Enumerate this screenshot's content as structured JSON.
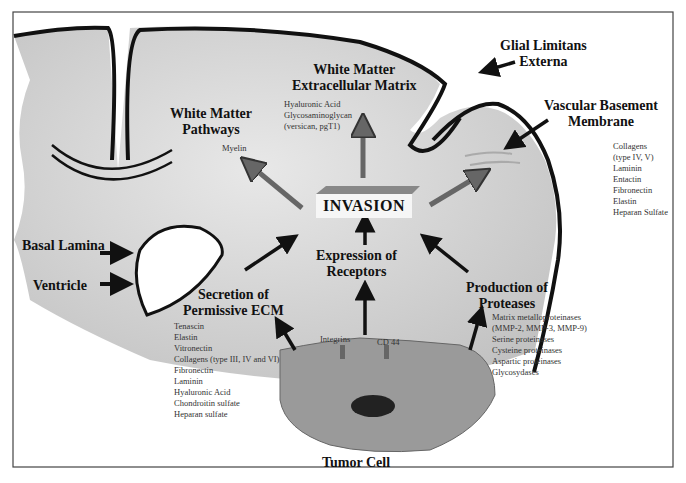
{
  "labels": {
    "glial_limitans": "Glial Limitans\nExterna",
    "wm_ecm_title": "White Matter\nExtracellular Matrix",
    "wm_ecm_items": [
      "Hyaluronic Acid",
      "Glycosaminoglycan",
      "(versican, pgT1)"
    ],
    "wm_pathways_title": "White Matter\nPathways",
    "wm_pathways_items": [
      "Myelin"
    ],
    "vascular_title": "Vascular Basement\nMembrane",
    "vascular_items": [
      "Collagens",
      "(type IV, V)",
      "Laminin",
      "Entactin",
      "Fibronectin",
      "Elastin",
      "Heparan Sulfate"
    ],
    "invasion": "INVASION",
    "basal_lamina": "Basal Lamina",
    "ventricle": "Ventricle",
    "expression_title": "Expression of\nReceptors",
    "secretion_title": "Secretion of\nPermissive ECM",
    "secretion_items": [
      "Tenascin",
      "Elastin",
      "Vitronectin",
      "Collagens (type III, IV and VI)",
      "Fibronectin",
      "Laminin",
      "Hyaluronic Acid",
      "Chondroitin sulfate",
      "Heparan sulfate"
    ],
    "proteases_title": "Production of\nProteases",
    "proteases_items": [
      "Matrix metalloproteinases",
      "(MMP-2, MMP-3, MMP-9)",
      "Serine proteinases",
      "Cysteine proteinases",
      "Aspartic proteinases",
      "Glycosydases"
    ],
    "integrins": "Integrins",
    "cd44": "CD 44",
    "tumor_cell": "Tumor Cell"
  },
  "colors": {
    "brain_fill": "#c9c9c9",
    "cell_fill": "#9a9a9a",
    "outline": "#111111"
  }
}
